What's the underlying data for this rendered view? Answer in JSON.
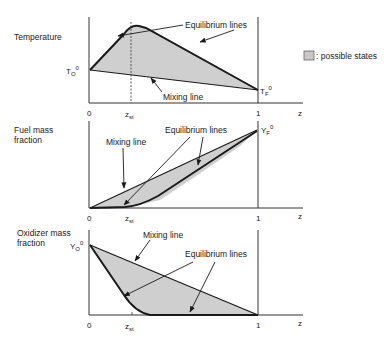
{
  "legend": {
    "swatch_color": "#c8c8c8",
    "label": ": possible states"
  },
  "panels": [
    {
      "ylabel": [
        "Temperature"
      ],
      "y0_label": "T",
      "y0_sub": "O",
      "y0_sup": "0",
      "y1_label": "T",
      "y1_sub": "F",
      "y1_sup": "0",
      "annotations": {
        "equilibrium": "Equilibrium  lines",
        "mixing": "Mixing  line"
      }
    },
    {
      "ylabel": [
        "Fuel mass",
        "fraction"
      ],
      "y1_label": "Y",
      "y1_sub": "F",
      "y1_sup": "0",
      "annotations": {
        "equilibrium": "Equilibrium  lines",
        "mixing": "Mixing  line"
      }
    },
    {
      "ylabel": [
        "Oxidizer mass",
        "fraction"
      ],
      "y0_label": "Y",
      "y0_sub": "O",
      "y0_sup": "0",
      "annotations": {
        "equilibrium": "Equilibrium  lines",
        "mixing": "Mixing  line"
      }
    }
  ],
  "axis": {
    "zero": "0",
    "one": "1",
    "zst": "z",
    "zst_sub": "st",
    "xlabel": "z"
  },
  "colors": {
    "fill": "#cfcfcf",
    "line": "#1a1a1a"
  }
}
